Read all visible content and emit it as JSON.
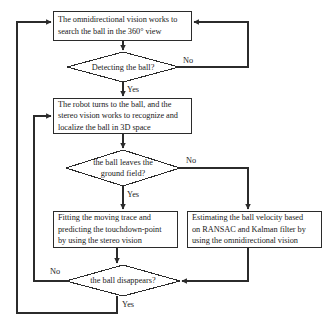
{
  "diagram": {
    "type": "flowchart",
    "nodes": {
      "n1": {
        "kind": "process",
        "name": "omnidirectional-search-box",
        "lines": [
          "The omnidirectional vision works to",
          "search the ball in the 360° view"
        ]
      },
      "d1": {
        "kind": "decision",
        "name": "detecting-ball-decision",
        "lines": [
          "Detecting the ball?"
        ]
      },
      "n2": {
        "kind": "process",
        "name": "robot-turns-stereo-box",
        "lines": [
          "The robot turns to the ball, and the",
          "stereo vision works to recognize and",
          "localize the ball in 3D space"
        ]
      },
      "d2": {
        "kind": "decision",
        "name": "ball-leaves-ground-decision",
        "lines": [
          "the ball leaves the",
          "ground field?"
        ]
      },
      "n3": {
        "kind": "process",
        "name": "fitting-trace-box",
        "lines": [
          "Fitting the moving trace and",
          "predicting the touchdown-point",
          "by using the stereo vision"
        ]
      },
      "n4": {
        "kind": "process",
        "name": "estimating-velocity-box",
        "lines": [
          "Estimating the ball velocity based",
          "on RANSAC and Kalman filter by",
          "using the omnidirectional vision"
        ]
      },
      "d3": {
        "kind": "decision",
        "name": "ball-disappears-decision",
        "lines": [
          "the ball disappears?"
        ]
      }
    },
    "edge_labels": {
      "d1_no": "No",
      "d1_yes": "Yes",
      "d2_no": "No",
      "d2_yes": "Yes",
      "d3_no": "No",
      "d3_yes": "Yes"
    },
    "colors": {
      "stroke": "#2b2b2b",
      "text": "#1a1a1a",
      "background": "#ffffff"
    }
  }
}
